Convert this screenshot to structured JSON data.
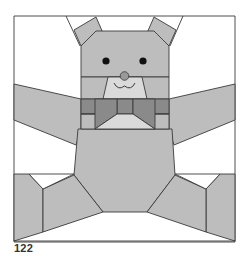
{
  "figure": {
    "page_number": "122",
    "colors": {
      "outline": "#3a3a3a",
      "light_gray": "#bdbdbd",
      "lighter_gray": "#dadada",
      "mid_gray": "#a0a0a0",
      "dark_gray": "#8a8a8a",
      "background": "#ffffff",
      "eye": "#111111",
      "nose": "#999999"
    },
    "parts": [
      "left-ear",
      "right-ear",
      "head",
      "eyes",
      "nose",
      "mouth",
      "muzzle",
      "bow-tie",
      "left-arm",
      "right-arm",
      "body",
      "left-leg",
      "right-leg"
    ]
  }
}
